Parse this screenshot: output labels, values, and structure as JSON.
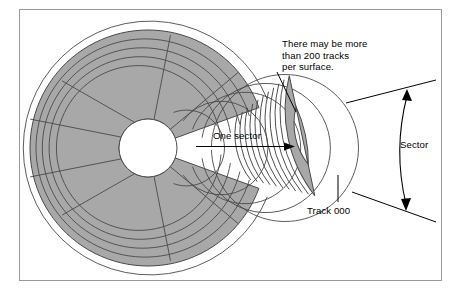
{
  "figure": {
    "background_color": "#ffffff",
    "frame_color": "#9a9a9a",
    "disk_fill_color": "#a8a8a8",
    "line_color": "#4a4a4a",
    "text_color": "#000000"
  },
  "labels": {
    "tracks_note": "There may be more\nthan 200 tracks\nper surface.",
    "tracks_note_lines": [
      "There may be more",
      "than 200 tracks",
      "per surface."
    ],
    "one_sector": "One sector",
    "sector": "Sector",
    "track_000": "Track 000"
  },
  "diagram_data": {
    "type": "diagram",
    "subject": "magnetic disk surface",
    "disk": {
      "center_x": 148,
      "center_y": 148,
      "outer_radius": 118,
      "hub_radius": 29,
      "track_count": 11,
      "sector_count": 9,
      "sector_angle_degrees": 40,
      "cutaway_sector_start_degrees": -20,
      "cutaway_sector_end_degrees": 20,
      "cutaway_present": true
    },
    "magnified_sector": {
      "center_x": 244,
      "center_y": 148,
      "inner_radius": 66,
      "outer_radius": 140,
      "start_angle_degrees": -26,
      "end_angle_degrees": 26,
      "rotation_degrees": -12,
      "track_count": 11,
      "innermost_track_label": "Track 000"
    },
    "annotations": [
      {
        "name": "tracks-note",
        "text": "There may be more than 200 tracks per surface.",
        "leader_from": [
          278,
          70
        ],
        "leader_to": [
          296,
          110
        ]
      },
      {
        "name": "one-sector-arrow",
        "text": "One sector",
        "arrow_from": [
          196,
          146
        ],
        "arrow_to": [
          288,
          146
        ]
      },
      {
        "name": "sector-dimension",
        "text": "Sector",
        "style": "double-headed curved arrow"
      },
      {
        "name": "track-000-leader",
        "text": "Track 000",
        "leader_from": [
          338,
          201
        ],
        "leader_to": [
          338,
          176
        ]
      }
    ]
  }
}
